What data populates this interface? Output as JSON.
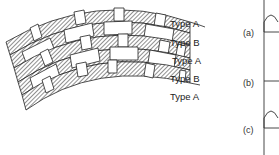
{
  "figure": {
    "arch": {
      "course_labels": [
        "Type A",
        "Type B",
        "Type A",
        "Type B",
        "Type A"
      ],
      "hatch_color": "#333333",
      "line_color": "#222222"
    },
    "details": {
      "labels": [
        "(a)",
        "(b)",
        "(c)"
      ]
    }
  }
}
